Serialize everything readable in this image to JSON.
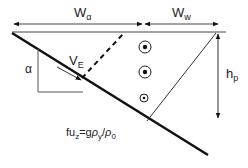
{
  "diagram": {
    "labels": {
      "w_alpha": {
        "main": "W",
        "sub": "α"
      },
      "w_w": {
        "main": "W",
        "sub": "w"
      },
      "v_e": {
        "main": "V",
        "sub": "E"
      },
      "alpha": "α",
      "h_p": {
        "main": "h",
        "sub": "p"
      },
      "formula": {
        "part1": "fu",
        "sub1": "z",
        "part2": "=g",
        "rho1": "ρ",
        "sub2": "y",
        "slash": "/",
        "rho2": "ρ",
        "sub3": "0"
      }
    },
    "symbols": {
      "circle_dots": 3
    },
    "colors": {
      "line": "#111111",
      "thin_line": "#444444"
    }
  }
}
